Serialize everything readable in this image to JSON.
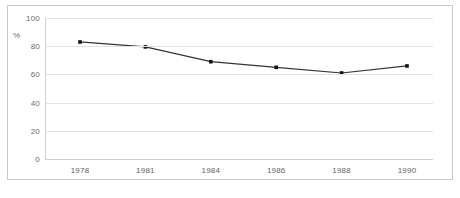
{
  "chart_data": {
    "type": "line",
    "title": "",
    "xlabel": "",
    "ylabel": "%",
    "categories": [
      "1978",
      "1981",
      "1984",
      "1986",
      "1988",
      "1990"
    ],
    "values": [
      83,
      79.5,
      69,
      65,
      61,
      66
    ],
    "series": [
      {
        "name": "",
        "values": [
          83,
          79.5,
          69,
          65,
          61,
          66
        ]
      }
    ],
    "ylim": [
      0,
      100
    ],
    "yticks": [
      0,
      20,
      40,
      60,
      80,
      100
    ],
    "ytick_labels": [
      "0",
      "20",
      "40",
      "60",
      "80",
      "100"
    ],
    "grid": true,
    "legend": "none",
    "line_color": "#333333",
    "marker_color": "#111111",
    "grid_color": "#e2e2e2",
    "frame_color": "#c9c9c9",
    "label_color": "#6d6d6d"
  },
  "figure": {
    "unit_label": "%",
    "caption": ""
  }
}
